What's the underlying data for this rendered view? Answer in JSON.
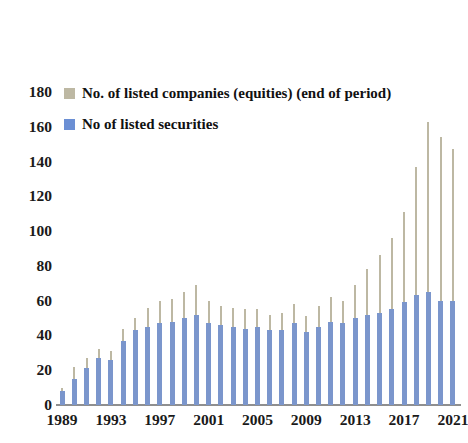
{
  "legend": {
    "position": "top-left-inside",
    "items": [
      {
        "label": "No. of listed companies (equities) (end of period)",
        "color": "#bdb8a3",
        "swatch_name": "legend-swatch-companies"
      },
      {
        "label": "No of listed securities",
        "color": "#6b8fd4",
        "swatch_name": "legend-swatch-securities"
      }
    ]
  },
  "chart_data": {
    "type": "bar",
    "title": "",
    "subtitle": "",
    "xlabel": "",
    "ylabel": "",
    "ylim": [
      0,
      180
    ],
    "ytick_step": 20,
    "yticks": [
      180,
      160,
      140,
      120,
      100,
      80,
      60,
      40,
      20,
      0
    ],
    "grid": false,
    "legend_position": "top-left",
    "x_tick_labels": [
      "1989",
      "1993",
      "1997",
      "2001",
      "2005",
      "2009",
      "2013",
      "2017",
      "2021"
    ],
    "x_tick_interval": 4,
    "categories": [
      "1989",
      "1990",
      "1991",
      "1992",
      "1993",
      "1994",
      "1995",
      "1996",
      "1997",
      "1998",
      "1999",
      "2000",
      "2001",
      "2002",
      "2003",
      "2004",
      "2005",
      "2006",
      "2007",
      "2008",
      "2009",
      "2010",
      "2011",
      "2012",
      "2013",
      "2014",
      "2015",
      "2016",
      "2017",
      "2018",
      "2019",
      "2020",
      "2021"
    ],
    "series": [
      {
        "name": "No. of listed companies (equities) (end of period)",
        "color": "#bdb8a3",
        "values": [
          10,
          22,
          27,
          32,
          31,
          44,
          50,
          56,
          60,
          61,
          65,
          69,
          60,
          57,
          56,
          55,
          55,
          52,
          53,
          58,
          51,
          57,
          62,
          60,
          69,
          78,
          86,
          96,
          111,
          137,
          163,
          154,
          147
        ]
      },
      {
        "name": "No of listed securities",
        "color": "#7b96cc",
        "values": [
          8,
          15,
          21,
          27,
          26,
          37,
          43,
          45,
          47,
          48,
          50,
          52,
          47,
          46,
          45,
          44,
          45,
          43,
          43,
          47,
          42,
          45,
          48,
          47,
          50,
          52,
          53,
          55,
          59,
          63,
          65,
          60,
          60
        ]
      }
    ]
  }
}
